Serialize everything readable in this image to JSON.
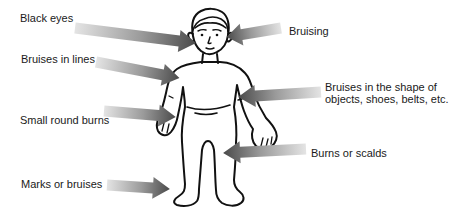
{
  "diagram": {
    "figure": "child-body-outline",
    "labels": {
      "black_eyes": "Black eyes",
      "bruising": "Bruising",
      "bruises_in_lines": "Bruises in lines",
      "bruises_shape_line1": "Bruises in the shape of",
      "bruises_shape_line2": "objects, shoes, belts, etc.",
      "small_round_burns": "Small round burns",
      "burns_or_scalds": "Burns or scalds",
      "marks_or_bruises": "Marks or bruises"
    },
    "colors": {
      "background": "#ffffff",
      "outline": "#111111",
      "text": "#1a1a1a",
      "arrow_dark": "#4a4a4a",
      "arrow_light": "#e4e4e4"
    }
  }
}
